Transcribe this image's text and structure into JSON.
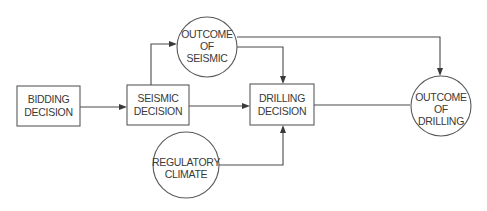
{
  "diagram": {
    "type": "influence-diagram",
    "nodes": [
      {
        "id": "bidding",
        "shape": "rect",
        "lines": [
          "BIDDING",
          "DECISION"
        ]
      },
      {
        "id": "seismic",
        "shape": "rect",
        "lines": [
          "SEISMIC",
          "DECISION"
        ]
      },
      {
        "id": "outcome_seismic",
        "shape": "circle",
        "lines": [
          "OUTCOME",
          "OF",
          "SEISMIC"
        ]
      },
      {
        "id": "drilling",
        "shape": "rect",
        "lines": [
          "DRILLING",
          "DECISION"
        ]
      },
      {
        "id": "regulatory",
        "shape": "circle",
        "lines": [
          "REGULATORY",
          "CLIMATE"
        ]
      },
      {
        "id": "outcome_drilling",
        "shape": "circle",
        "lines": [
          "OUTCOME",
          "OF",
          "DRILLING"
        ]
      }
    ],
    "edges": [
      {
        "from": "bidding",
        "to": "seismic"
      },
      {
        "from": "seismic",
        "to": "outcome_seismic"
      },
      {
        "from": "seismic",
        "to": "drilling"
      },
      {
        "from": "outcome_seismic",
        "to": "drilling"
      },
      {
        "from": "outcome_seismic",
        "to": "outcome_drilling"
      },
      {
        "from": "regulatory",
        "to": "drilling"
      },
      {
        "from": "drilling",
        "to": "outcome_drilling"
      }
    ],
    "colors": {
      "line": "#4a4a4a",
      "text": "#3a3a3a",
      "background": "#ffffff"
    }
  }
}
